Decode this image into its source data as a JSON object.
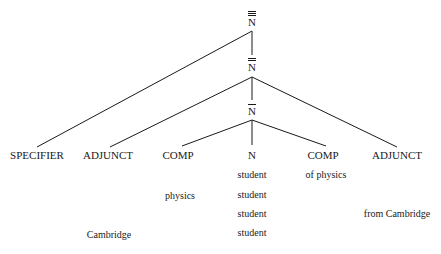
{
  "diagram": {
    "type": "syntax-tree",
    "nodes": {
      "n3": {
        "label": "N",
        "bars": 3
      },
      "n2": {
        "label": "N",
        "bars": 2
      },
      "n1": {
        "label": "N",
        "bars": 1
      },
      "n0": {
        "label": "N",
        "bars": 0
      }
    },
    "categories": {
      "specifier": "SPECIFIER",
      "adjunct_left": "ADJUNCT",
      "comp_left": "COMP",
      "head": "N",
      "comp_right": "COMP",
      "adjunct_right": "ADJUNCT"
    },
    "words": {
      "comp_left_word": "physics",
      "head_words": [
        "student",
        "student",
        "student",
        "student"
      ],
      "comp_right_word": "of physics",
      "adjunct_right_word": "from Cambridge",
      "adjunct_left_word": "Cambridge"
    },
    "line_color": "#1a1a1a"
  }
}
